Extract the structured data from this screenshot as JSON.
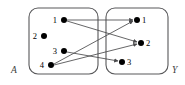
{
  "diagram": {
    "type": "set-mapping-arrow-diagram",
    "sets": [
      {
        "id": "A",
        "label": "A",
        "label_position": "bottom-left-outside",
        "box": {
          "x": 29,
          "y": 8,
          "width": 69,
          "height": 66,
          "corner_radius": 9
        },
        "label_xy": {
          "x": 11,
          "y": 73
        },
        "elements": [
          {
            "name": "1",
            "label": "1",
            "x": 64,
            "y": 20,
            "label_x": 57,
            "label_y": 23
          },
          {
            "name": "2",
            "label": "2",
            "x": 44,
            "y": 36,
            "label_x": 37,
            "label_y": 39
          },
          {
            "name": "3",
            "label": "3",
            "x": 64,
            "y": 51,
            "label_x": 57,
            "label_y": 54
          },
          {
            "name": "4",
            "label": "4",
            "x": 51,
            "y": 65,
            "label_x": 44,
            "label_y": 68
          }
        ]
      },
      {
        "id": "Y",
        "label": "Y",
        "label_position": "bottom-right-outside",
        "box": {
          "x": 106,
          "y": 8,
          "width": 62,
          "height": 66,
          "corner_radius": 9
        },
        "label_xy": {
          "x": 172,
          "y": 73
        },
        "elements": [
          {
            "name": "1",
            "label": "1",
            "x": 137,
            "y": 20,
            "label_x": 142,
            "label_y": 23
          },
          {
            "name": "2",
            "label": "2",
            "x": 141,
            "y": 43,
            "label_x": 146,
            "label_y": 46
          },
          {
            "name": "3",
            "label": "3",
            "x": 122,
            "y": 62,
            "label_x": 127,
            "label_y": 65
          }
        ]
      }
    ],
    "dot_radius": 3.0,
    "edges": [
      {
        "name": "edge-a1-y1",
        "from_set": "A",
        "from": "1",
        "to_set": "Y",
        "to": "1",
        "x1": 67,
        "y1": 20,
        "x2": 133,
        "y2": 20
      },
      {
        "name": "edge-a1-y2",
        "from_set": "A",
        "from": "1",
        "to_set": "Y",
        "to": "2",
        "x1": 67,
        "y1": 21,
        "x2": 137,
        "y2": 42
      },
      {
        "name": "edge-a3-y3",
        "from_set": "A",
        "from": "3",
        "to_set": "Y",
        "to": "3",
        "x1": 67,
        "y1": 52,
        "x2": 118,
        "y2": 61
      },
      {
        "name": "edge-a4-y1",
        "from_set": "A",
        "from": "4",
        "to_set": "Y",
        "to": "1",
        "x1": 54,
        "y1": 64,
        "x2": 133,
        "y2": 21
      },
      {
        "name": "edge-a4-y2",
        "from_set": "A",
        "from": "4",
        "to_set": "Y",
        "to": "2",
        "x1": 54,
        "y1": 65,
        "x2": 137,
        "y2": 44
      }
    ],
    "colors": {
      "box_stroke": "#58585a",
      "edge_stroke": "#4a4a4c",
      "dot_fill": "#000000",
      "background": "#ffffff"
    }
  }
}
